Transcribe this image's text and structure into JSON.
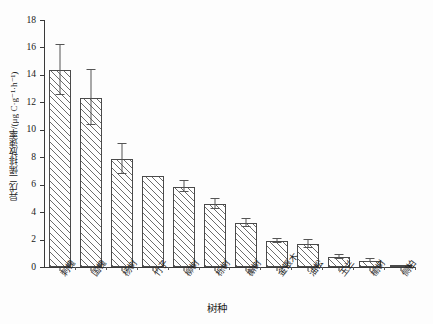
{
  "chart_data": {
    "type": "bar",
    "title": "",
    "subtitle": "",
    "xlabel": "树种",
    "ylabel": "异戊二烯排放速率/(μg C·g⁻¹·h⁻¹)",
    "ylim": [
      0,
      18
    ],
    "yticks": [
      0,
      2,
      4,
      6,
      8,
      10,
      12,
      14,
      16,
      18
    ],
    "ytick_labels": [
      "0",
      "2",
      "4",
      "6",
      "8",
      "10",
      "12",
      "14",
      "16",
      "18"
    ],
    "grid": false,
    "legend": null,
    "legend_position": "none",
    "bar_style": {
      "fill": "#ffffff",
      "hatch": "diagonal-45",
      "hatch_color": "#6d6d6d",
      "edge_color": "#4a4a4a",
      "error_bar_color": "#555555"
    },
    "categories": [
      "刺槐",
      "国槐",
      "杨树",
      "竹子",
      "柳树",
      "栎树",
      "槲树",
      "金银木",
      "油松",
      "玉兰",
      "榆树",
      "侧柏"
    ],
    "values": [
      14.35,
      12.35,
      7.85,
      6.6,
      5.85,
      4.6,
      3.2,
      1.9,
      1.7,
      0.75,
      0.45,
      0.05
    ],
    "errors": [
      1.8,
      2.0,
      1.1,
      0.0,
      0.4,
      0.35,
      0.3,
      0.15,
      0.3,
      0.15,
      0.1,
      0.02
    ],
    "value_labels": [
      "",
      "",
      "",
      "",
      "",
      "",
      "",
      "",
      "",
      "",
      "",
      ""
    ]
  }
}
